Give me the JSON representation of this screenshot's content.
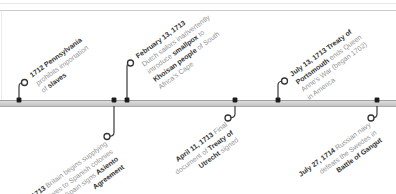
{
  "canvas": {
    "width": 396,
    "height": 194,
    "background": "#ffffff"
  },
  "frame": {
    "top_line1_y": 3,
    "top_line1_color": "#e8e8e8",
    "top_line2_y": 10,
    "top_line2_color": "#cccccc",
    "left_line_x": 1,
    "left_line_color": "#ececec"
  },
  "axis": {
    "y": 100,
    "height": 7
  },
  "colors": {
    "band_light": "#dcdcdc",
    "band_dark": "#c3c3c3",
    "band_border": "#9f9f9f",
    "leader": "#3a3a3a",
    "marker_fill": "#1c1c1c",
    "ring_fill": "#ffffff",
    "ring_stroke": "#333333",
    "bold_text": "#303030",
    "regular_text": "#939393"
  },
  "label_angle_deg": -36,
  "icons": [
    {
      "name": "event-marker",
      "shape": "small-black-square-on-axis"
    },
    {
      "name": "event-ring",
      "shape": "open-circle-leader-endpoint"
    }
  ],
  "events": [
    {
      "id": "1712-pennsylvania-slave-import-ban",
      "side": "top",
      "dot_x": 19,
      "ring_x": 24.5,
      "ring_y": 82.5,
      "label_x": 28,
      "label_y": 72,
      "lines": [
        [
          {
            "text": "1712 Pennsylvania",
            "bold": true
          }
        ],
        [
          {
            "text": "prohibits importation",
            "bold": false
          }
        ],
        [
          {
            "text": "of ",
            "bold": false
          },
          {
            "text": "slaves",
            "bold": true
          }
        ]
      ]
    },
    {
      "id": "1713-britain-asiento-agreement",
      "side": "bottom",
      "dot_x": 114,
      "ring_x": 107,
      "ring_y": 136.5,
      "label_right_x": 103,
      "label_y": 139,
      "lines": [
        [
          {
            "text": "1713",
            "bold": true
          },
          {
            "text": " Britain begins supplying",
            "bold": false
          }
        ],
        [
          {
            "text": "slaves to Spanish colonies",
            "bold": false
          }
        ],
        [
          {
            "text": "after Spain signs ",
            "bold": false
          },
          {
            "text": "Asiento",
            "bold": true
          }
        ],
        [
          {
            "text": "Agreement",
            "bold": true
          }
        ]
      ]
    },
    {
      "id": "1713-02-13-smallpox-khoisan",
      "side": "top",
      "dot_x": 127,
      "ring_x": 130.5,
      "ring_y": 63,
      "label_x": 134,
      "label_y": 53,
      "lines": [
        [
          {
            "text": "February 13, 1713",
            "bold": true
          }
        ],
        [
          {
            "text": "Dutch sailors inadvertently",
            "bold": false
          }
        ],
        [
          {
            "text": "introduce ",
            "bold": false
          },
          {
            "text": "smallpox",
            "bold": true
          },
          {
            "text": " to",
            "bold": false
          }
        ],
        [
          {
            "text": "Khoisan people",
            "bold": true
          },
          {
            "text": " of South",
            "bold": false
          }
        ],
        [
          {
            "text": "Africa's Cape",
            "bold": false
          }
        ]
      ]
    },
    {
      "id": "1713-04-11-treaty-of-utrecht",
      "side": "bottom",
      "dot_x": 235,
      "ring_x": 228,
      "ring_y": 118,
      "label_right_x": 224,
      "label_y": 120,
      "lines": [
        [
          {
            "text": "April 11, 1713",
            "bold": true
          },
          {
            "text": " Final",
            "bold": false
          }
        ],
        [
          {
            "text": "document of ",
            "bold": false
          },
          {
            "text": "Treaty of",
            "bold": true
          }
        ],
        [
          {
            "text": "Utrecht",
            "bold": true
          },
          {
            "text": " signed",
            "bold": false
          }
        ]
      ]
    },
    {
      "id": "1713-07-13-treaty-of-portsmouth",
      "side": "top",
      "dot_x": 278,
      "ring_x": 284.5,
      "ring_y": 81,
      "label_x": 288,
      "label_y": 71,
      "lines": [
        [
          {
            "text": "July 13, 1713 Treaty of",
            "bold": true
          }
        ],
        [
          {
            "text": "Portsmouth",
            "bold": true
          },
          {
            "text": " ends Queen",
            "bold": false
          }
        ],
        [
          {
            "text": "Anne's War (began 1702)",
            "bold": false
          }
        ],
        [
          {
            "text": "in America",
            "bold": false
          }
        ]
      ]
    },
    {
      "id": "1714-07-27-battle-of-gangut",
      "side": "bottom",
      "dot_x": 377,
      "ring_x": 371,
      "ring_y": 118,
      "label_right_x": 367,
      "label_y": 120,
      "lines": [
        [
          {
            "text": "July 27, 1714",
            "bold": true
          },
          {
            "text": " Russian navy",
            "bold": false
          }
        ],
        [
          {
            "text": "defeats the Swedes in",
            "bold": false
          }
        ],
        [
          {
            "text": "Battle of Gangut",
            "bold": true
          }
        ]
      ]
    }
  ]
}
